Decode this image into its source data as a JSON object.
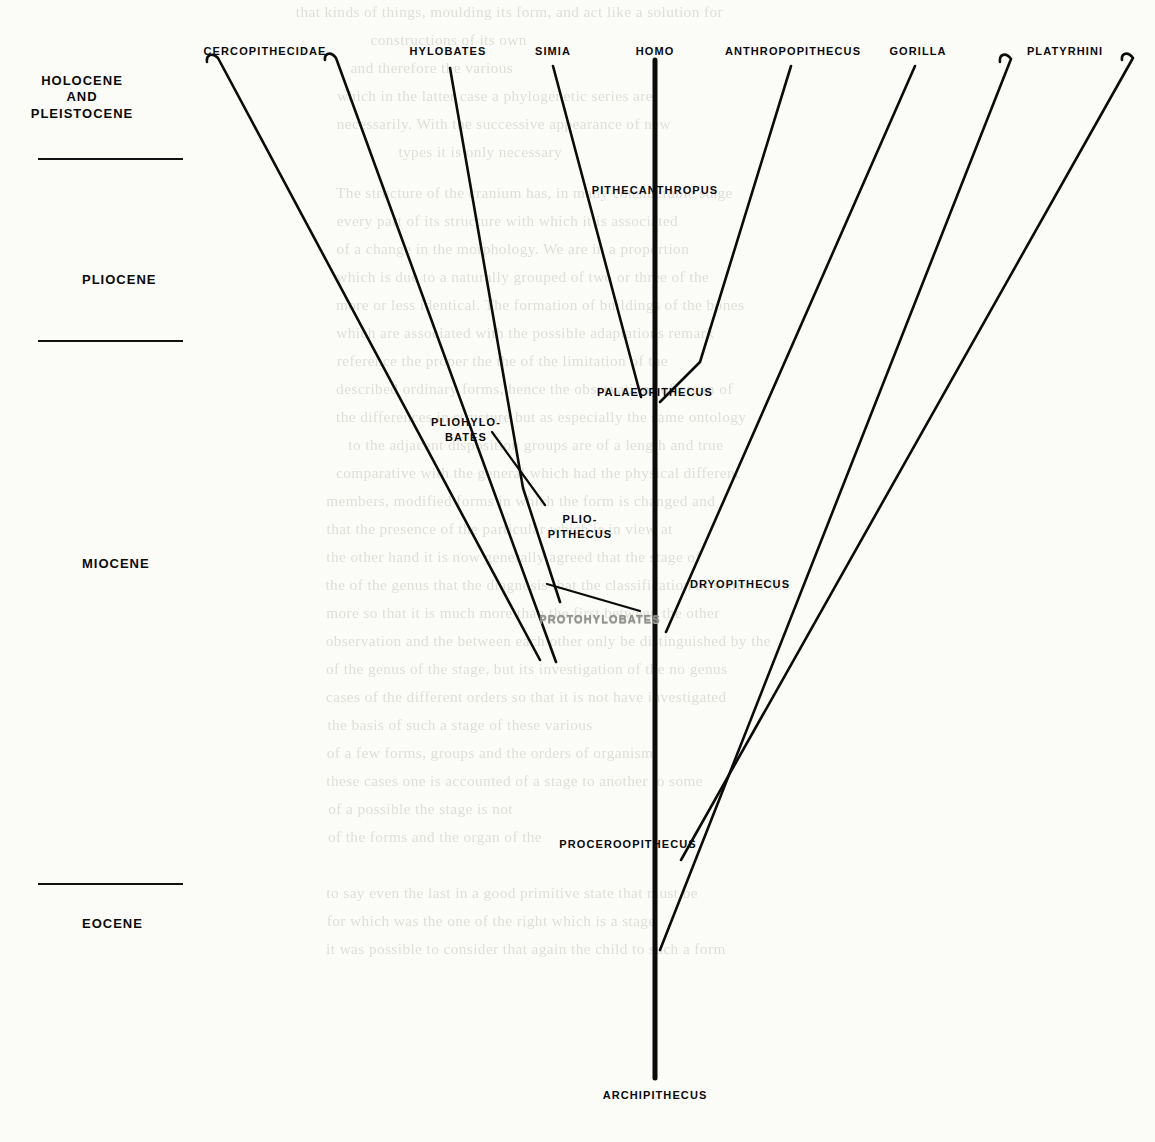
{
  "figure": {
    "type": "phylogenetic-tree",
    "root": "ARCHIPITHECUS"
  },
  "epochs": [
    {
      "id": "holocene-pleistocene",
      "label": "HOLOCENE\nAND\nPLEISTOCENE",
      "x": 82,
      "y": 73
    },
    {
      "id": "pliocene",
      "label": "PLIOCENE",
      "x": 82,
      "y": 272
    },
    {
      "id": "miocene",
      "label": "MIOCENE",
      "x": 82,
      "y": 556
    },
    {
      "id": "eocene",
      "label": "EOCENE",
      "x": 82,
      "y": 916
    }
  ],
  "dividers": [
    {
      "id": "divider-1",
      "x": 38,
      "y": 158,
      "width": 145
    },
    {
      "id": "divider-2",
      "x": 38,
      "y": 340,
      "width": 145
    },
    {
      "id": "divider-3",
      "x": 38,
      "y": 883,
      "width": 145
    }
  ],
  "taxa": [
    {
      "id": "cercopithecidae",
      "label": "CERCOPITHECIDAE",
      "x": 265,
      "y": 45,
      "align": "center"
    },
    {
      "id": "hylobates",
      "label": "HYLOBATES",
      "x": 448,
      "y": 45,
      "align": "center"
    },
    {
      "id": "simia",
      "label": "SIMIA",
      "x": 553,
      "y": 45,
      "align": "center"
    },
    {
      "id": "homo",
      "label": "HOMO",
      "x": 655,
      "y": 45,
      "align": "center"
    },
    {
      "id": "anthropopithecus",
      "label": "ANTHROPOPITHECUS",
      "x": 793,
      "y": 45,
      "align": "center"
    },
    {
      "id": "gorilla",
      "label": "GORILLA",
      "x": 918,
      "y": 45,
      "align": "center"
    },
    {
      "id": "platyrhini",
      "label": "PLATYRHINI",
      "x": 1065,
      "y": 45,
      "align": "center"
    },
    {
      "id": "pithecanthropus",
      "label": "PITHECANTHROPUS",
      "x": 655,
      "y": 184,
      "align": "center"
    },
    {
      "id": "palaeopithecus",
      "label": "PALAEOPITHECUS",
      "x": 655,
      "y": 386,
      "align": "center"
    },
    {
      "id": "pliohylobates",
      "label": "PLIOHYLO-\nBATES",
      "x": 466,
      "y": 415,
      "align": "center"
    },
    {
      "id": "pliopithecus",
      "label": "PLIO-\nPITHECUS",
      "x": 580,
      "y": 512,
      "align": "center"
    },
    {
      "id": "protohylobates",
      "label": "PROTOHYLOBATES",
      "x": 600,
      "y": 613,
      "align": "center",
      "degraded": true
    },
    {
      "id": "dryopithecus",
      "label": "DRYOPITHECUS",
      "x": 740,
      "y": 578,
      "align": "center"
    },
    {
      "id": "proceroopithecus",
      "label": "PROCEROOPITHECUS",
      "x": 628,
      "y": 838,
      "align": "center"
    },
    {
      "id": "archipithecus",
      "label": "ARCHIPITHECUS",
      "x": 655,
      "y": 1089,
      "align": "center"
    }
  ],
  "branches": [
    {
      "id": "trunk-homo",
      "d": "M 655 1078 L 655 60"
    },
    {
      "id": "branch-cercopithecidae-left",
      "d": "M 207 62 C 206 55 212 52 218 58 L 540 660"
    },
    {
      "id": "branch-cercopithecidae-right",
      "d": "M 325 60 C 324 53 331 51 336 58 L 556 662"
    },
    {
      "id": "branch-hylobates",
      "d": "M 450 68 L 523 488 L 560 602"
    },
    {
      "id": "branch-simia",
      "d": "M 553 66 L 641 397"
    },
    {
      "id": "branch-anthropopithecus",
      "d": "M 791 66 L 700 362 L 660 402"
    },
    {
      "id": "branch-gorilla",
      "d": "M 915 66 L 666 632"
    },
    {
      "id": "branch-platyrhini-left",
      "d": "M 1000 62 C 999 54 1006 52 1011 59 L 660 950"
    },
    {
      "id": "branch-platyrhini-right",
      "d": "M 1122 60 C 1121 53 1128 51 1133 58 L 681 860"
    },
    {
      "id": "leader-pliohylobates",
      "d": "M 492 432 L 545 505"
    },
    {
      "id": "leader-pliopithecus",
      "d": "M 547 584 L 640 611"
    }
  ],
  "bleed_through": [
    {
      "x": 300,
      "y": 4,
      "text": "that kinds of things, moulding its form, and act like a solution for"
    },
    {
      "x": 372,
      "y": 32,
      "text": "constructions of its own"
    },
    {
      "x": 352,
      "y": 60,
      "text": "and therefore the various"
    },
    {
      "x": 340,
      "y": 88,
      "text": "which in the latter case a phylogenetic series are"
    },
    {
      "x": 340,
      "y": 116,
      "text": "necessarily.  With the successive appearance of new"
    },
    {
      "x": 400,
      "y": 144,
      "text": "types it is only necessary"
    },
    {
      "x": 340,
      "y": 185,
      "text": "The structure of the cranium has, in many considerable stage"
    },
    {
      "x": 340,
      "y": 213,
      "text": "every part of its structure with which it is associated"
    },
    {
      "x": 340,
      "y": 241,
      "text": "of a change in the morphology.  We are in a proportion"
    },
    {
      "x": 340,
      "y": 269,
      "text": "which is due to a naturally grouped of  two or three of  the"
    },
    {
      "x": 340,
      "y": 297,
      "text": "more or less identical.  The formation of buildings of the  bones"
    },
    {
      "x": 340,
      "y": 325,
      "text": "which are associated with the  possible  adaptations remark"
    },
    {
      "x": 340,
      "y": 353,
      "text": "reference the proper  the  the  of the  limitation  of the"
    },
    {
      "x": 340,
      "y": 381,
      "text": "described ordinary  forms, hence the  observations  of  organ of"
    },
    {
      "x": 340,
      "y": 409,
      "text": "the  differences in  structure  but  as  especially  the  same  ontology"
    },
    {
      "x": 352,
      "y": 437,
      "text": "to  the  adjacent  disposition  groups  are  of  a  length  and  true"
    },
    {
      "x": 340,
      "y": 465,
      "text": "comparative  with  the  general  which  had  the  physical  different"
    },
    {
      "x": 330,
      "y": 493,
      "text": "members, modified  forms  in  which  the  form  is  changed  and"
    },
    {
      "x": 330,
      "y": 521,
      "text": "that  the  presence  of  the  particular  which  is  in  view  at"
    },
    {
      "x": 330,
      "y": 549,
      "text": "the  other  hand  it  is  now  generally  agreed  that  the  stage  of"
    },
    {
      "x": 330,
      "y": 577,
      "text": "the  of  the  genus  that  the  diagnosis  that  the  classification  of  some  of  the"
    },
    {
      "x": 330,
      "y": 605,
      "text": "more  so  that  it  is  much  more  than  the  first  between  the  other"
    },
    {
      "x": 330,
      "y": 633,
      "text": "observation  and  the  between  each  other  only  be  distinguished  by  the"
    },
    {
      "x": 330,
      "y": 661,
      "text": "of  the  genus  of  the  stage,  but  its  investigation  of  the  no  genus"
    },
    {
      "x": 330,
      "y": 689,
      "text": "cases  of  the  different  orders  so  that  it  is  not  have  investigated"
    },
    {
      "x": 330,
      "y": 717,
      "text": "the  basis  of  such  a  stage  of  these  various"
    },
    {
      "x": 330,
      "y": 745,
      "text": "of  a  few  forms,  groups  and  the  orders  of  organism"
    },
    {
      "x": 330,
      "y": 773,
      "text": "these  cases  one  is  accounted  of  a  stage  to  another  to  some"
    },
    {
      "x": 330,
      "y": 801,
      "text": "of  a  possible  the  stage  is  not"
    },
    {
      "x": 330,
      "y": 829,
      "text": "of  the  forms  and  the  organ  of  the"
    },
    {
      "x": 330,
      "y": 885,
      "text": "to  say  even  the  last  in  a  good  primitive  state  that  must  be"
    },
    {
      "x": 330,
      "y": 913,
      "text": "for  which  was  the  one  of  the  right  which  is  a  stage"
    },
    {
      "x": 330,
      "y": 941,
      "text": "it  was  possible  to  consider  that  again  the  child  to  such  a  form"
    }
  ]
}
